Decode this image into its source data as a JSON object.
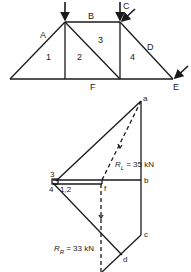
{
  "truss": {
    "space_labels": {
      "A": "A",
      "B": "B",
      "C": "C",
      "D": "D",
      "E": "E",
      "F": "F"
    },
    "panel_labels": [
      "1",
      "2",
      "3",
      "4"
    ]
  },
  "force_diagram": {
    "point_labels": {
      "a": "a",
      "b": "b",
      "c": "c",
      "d": "d",
      "f": "f",
      "p3": "3",
      "p4": "4",
      "p12": "1,2"
    },
    "reaction_left": {
      "symbol": "R",
      "subscript": "L",
      "text": "= 35 kN",
      "value": 35,
      "unit": "kN"
    },
    "reaction_right": {
      "symbol": "R",
      "subscript": "R",
      "text": "= 33 kN",
      "value": 33,
      "unit": "kN"
    }
  },
  "colors": {
    "line": "#1a1a1a",
    "text": "#222222",
    "background": "#ffffff"
  }
}
